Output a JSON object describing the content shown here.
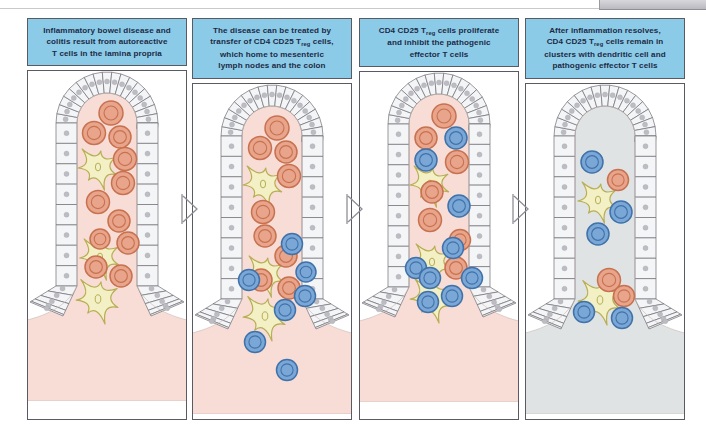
{
  "figure": {
    "title_visible": false,
    "colors": {
      "caption_bg": "#8ccbe8",
      "caption_text": "#1c2a45",
      "panel_border": "#5a5a62",
      "lamina_propria_inflamed": "#f7ddd6",
      "lamina_propria_resolved": "#dfe3e4",
      "submucosa_inflamed": "#f9ddd6",
      "submucosa_resolved": "#dde2e3",
      "epithelium_fill": "#f4f5f7",
      "epithelium_stroke": "#6e6e76",
      "epithelial_nucleus": "#bcbcc2",
      "effector_t_cell_fill": "#e8a58c",
      "effector_t_cell_ring": "#c8714f",
      "treg_cell_fill": "#7ba7d7",
      "treg_cell_ring": "#3f72aa",
      "dendritic_cell_fill": "#f2f0c4",
      "dendritic_cell_stroke": "#b8ae55",
      "arrow_stroke": "#8e8e96"
    },
    "panels": [
      {
        "id": "panel-1",
        "index": 1,
        "caption_parts": [
          "Inflammatory bowel disease and",
          "colitis result from autoreactive",
          "T cells in the lamina propria"
        ],
        "caption": "Inflammatory bowel disease and colitis result from autoreactive T cells in the lamina propria",
        "state": "inflamed",
        "effector_t_cells": 11,
        "treg_cells": 0,
        "dendritic_cells": 3
      },
      {
        "id": "panel-2",
        "index": 2,
        "caption_parts": [
          "The disease can be treated by",
          "transfer of CD4 CD25 T",
          "reg",
          " cells,",
          "which home to mesenteric",
          "lymph nodes and the colon"
        ],
        "caption": "The disease can be treated by transfer of CD4 CD25 Treg cells, which home to mesenteric lymph nodes and the colon",
        "state": "inflamed",
        "effector_t_cells": 9,
        "treg_cells": 7,
        "dendritic_cells": 3
      },
      {
        "id": "panel-3",
        "index": 3,
        "caption_parts": [
          "CD4  CD25 T",
          "reg",
          " cells proliferate",
          "and inhibit the pathogenic",
          "effector T cells"
        ],
        "caption": "CD4 CD25 Treg cells proliferate and inhibit the pathogenic effector T cells",
        "state": "inflamed",
        "effector_t_cells": 7,
        "treg_cells": 9,
        "dendritic_cells": 3
      },
      {
        "id": "panel-4",
        "index": 4,
        "caption_parts": [
          "After inflammation resolves,",
          "CD4 CD25 T",
          "reg",
          " cells remain in",
          "clusters with dendritic cell and",
          "pathogenic effector T cells"
        ],
        "caption": "After inflammation resolves, CD4 CD25 Treg cells remain in clusters with dendritic cell and pathogenic effector T cells",
        "state": "resolved",
        "effector_t_cells": 3,
        "treg_cells": 5,
        "dendritic_cells": 2
      }
    ],
    "arrows": [
      {
        "id": "arrow-1-to-2",
        "label": "chevron-right-icon"
      },
      {
        "id": "arrow-2-to-3",
        "label": "chevron-right-icon"
      },
      {
        "id": "arrow-3-to-4",
        "label": "chevron-right-icon"
      }
    ],
    "legend": {
      "effector_t_cell": "pathogenic effector T cell",
      "treg_cell": "CD4 CD25 Treg cell",
      "dendritic_cell": "dendritic cell",
      "epithelium": "intestinal epithelium",
      "lamina_propria": "lamina propria"
    }
  }
}
